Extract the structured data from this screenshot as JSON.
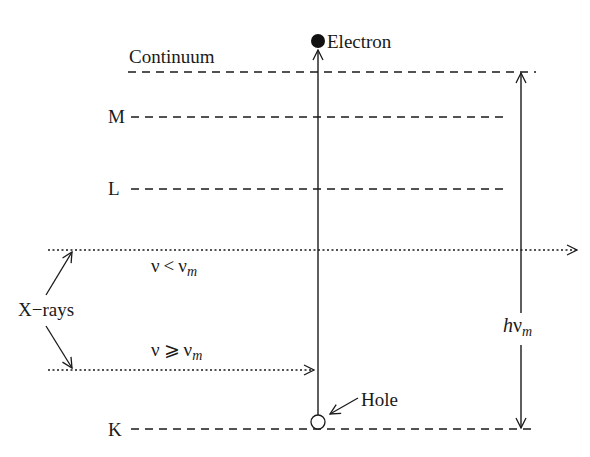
{
  "diagram": {
    "type": "energy-level diagram (X-ray emission / absorption)",
    "levels": [
      {
        "id": "continuum",
        "label": "Continuum",
        "y": 72
      },
      {
        "id": "M",
        "label": "M",
        "y": 117
      },
      {
        "id": "L",
        "label": "L",
        "y": 189
      },
      {
        "id": "K",
        "label": "K",
        "y": 429
      }
    ],
    "particles": {
      "electron": {
        "label": "Electron"
      },
      "hole": {
        "label": "Hole"
      }
    },
    "xrays": {
      "label": "X−rays",
      "upper": {
        "symbol": "ν",
        "relation": "<",
        "sub_symbol": "ν",
        "subscript": "m"
      },
      "lower": {
        "symbol": "ν",
        "relation": "⩾",
        "sub_symbol": "ν",
        "subscript": "m"
      }
    },
    "energy_span": {
      "prefix": "h",
      "symbol": "ν",
      "subscript": "m"
    },
    "colors": {
      "ink": "#1a1a1a",
      "background": "#ffffff"
    }
  }
}
